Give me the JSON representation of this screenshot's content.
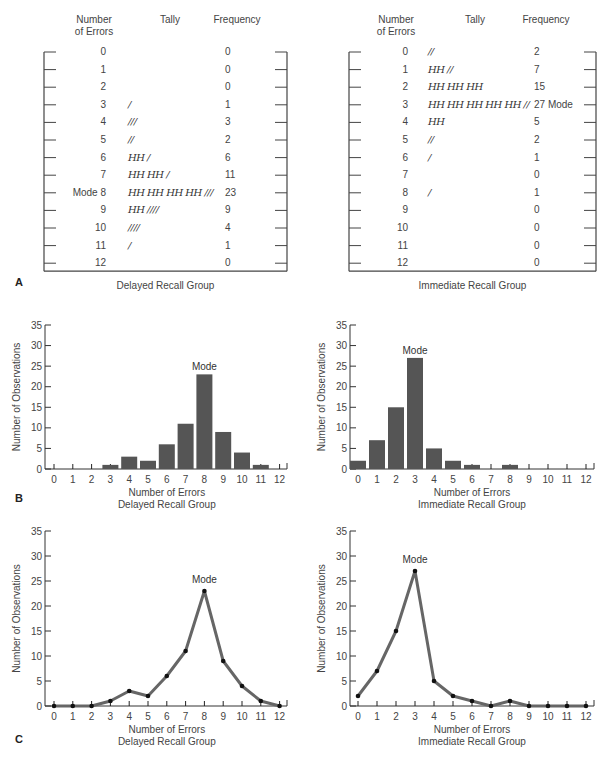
{
  "panels": {
    "A": {
      "letter": "A",
      "tables": [
        {
          "group": "Delayed Recall Group",
          "headers": {
            "errors": "Number\nof Errors",
            "tally": "Tally",
            "frequency": "Frequency"
          },
          "rows": [
            {
              "errors": "0",
              "tally": "",
              "frequency": "0"
            },
            {
              "errors": "1",
              "tally": "",
              "frequency": "0"
            },
            {
              "errors": "2",
              "tally": "",
              "frequency": "0"
            },
            {
              "errors": "3",
              "tally": "/",
              "frequency": "1"
            },
            {
              "errors": "4",
              "tally": "///",
              "frequency": "3"
            },
            {
              "errors": "5",
              "tally": "//",
              "frequency": "2"
            },
            {
              "errors": "6",
              "tally": "HH /",
              "frequency": "6"
            },
            {
              "errors": "7",
              "tally": "HH HH /",
              "frequency": "11"
            },
            {
              "errors": "Mode 8",
              "tally": "HH HH HH HH ///",
              "frequency": "23"
            },
            {
              "errors": "9",
              "tally": "HH ////",
              "frequency": "9"
            },
            {
              "errors": "10",
              "tally": "////",
              "frequency": "4"
            },
            {
              "errors": "11",
              "tally": "/",
              "frequency": "1"
            },
            {
              "errors": "12",
              "tally": "",
              "frequency": "0"
            }
          ]
        },
        {
          "group": "Immediate Recall Group",
          "headers": {
            "errors": "Number\nof Errors",
            "tally": "Tally",
            "frequency": "Frequency"
          },
          "rows": [
            {
              "errors": "0",
              "tally": "//",
              "frequency": "2"
            },
            {
              "errors": "1",
              "tally": "HH //",
              "frequency": "7"
            },
            {
              "errors": "2",
              "tally": "HH HH HH",
              "frequency": "15"
            },
            {
              "errors": "3",
              "tally": "HH HH HH HH HH //",
              "frequency": "27 Mode"
            },
            {
              "errors": "4",
              "tally": "HH",
              "frequency": "5"
            },
            {
              "errors": "5",
              "tally": "//",
              "frequency": "2"
            },
            {
              "errors": "6",
              "tally": "/",
              "frequency": "1"
            },
            {
              "errors": "7",
              "tally": "",
              "frequency": "0"
            },
            {
              "errors": "8",
              "tally": "/",
              "frequency": "1"
            },
            {
              "errors": "9",
              "tally": "",
              "frequency": "0"
            },
            {
              "errors": "10",
              "tally": "",
              "frequency": "0"
            },
            {
              "errors": "11",
              "tally": "",
              "frequency": "0"
            },
            {
              "errors": "12",
              "tally": "",
              "frequency": "0"
            }
          ]
        }
      ]
    },
    "B": {
      "letter": "B"
    },
    "C": {
      "letter": "C"
    }
  },
  "chart_data": [
    {
      "panel": "B-left",
      "type": "bar",
      "title": "",
      "xlabel": "Number of Errors",
      "subtitle": "Delayed Recall Group",
      "ylabel": "Number of Observations",
      "categories": [
        "0",
        "1",
        "2",
        "3",
        "4",
        "5",
        "6",
        "7",
        "8",
        "9",
        "10",
        "11",
        "12"
      ],
      "values": [
        0,
        0,
        0,
        1,
        3,
        2,
        6,
        11,
        23,
        9,
        4,
        1,
        0
      ],
      "yticks": [
        0,
        5,
        10,
        15,
        20,
        25,
        30,
        35
      ],
      "ylim": [
        0,
        35
      ],
      "annotation": {
        "text": "Mode",
        "x": "8"
      },
      "grid": false,
      "bar_color": "#555555"
    },
    {
      "panel": "B-right",
      "type": "bar",
      "title": "",
      "xlabel": "Number of Errors",
      "subtitle": "Immediate Recall Group",
      "ylabel": "Number of Observations",
      "categories": [
        "0",
        "1",
        "2",
        "3",
        "4",
        "5",
        "6",
        "7",
        "8",
        "9",
        "10",
        "11",
        "12"
      ],
      "values": [
        2,
        7,
        15,
        27,
        5,
        2,
        1,
        0,
        1,
        0,
        0,
        0,
        0
      ],
      "yticks": [
        0,
        5,
        10,
        15,
        20,
        25,
        30,
        35
      ],
      "ylim": [
        0,
        35
      ],
      "annotation": {
        "text": "Mode",
        "x": "3"
      },
      "grid": false,
      "bar_color": "#555555"
    },
    {
      "panel": "C-left",
      "type": "line",
      "title": "",
      "xlabel": "Number of Errors",
      "subtitle": "Delayed Recall Group",
      "ylabel": "Number of Observations",
      "categories": [
        "0",
        "1",
        "2",
        "3",
        "4",
        "5",
        "6",
        "7",
        "8",
        "9",
        "10",
        "11",
        "12"
      ],
      "values": [
        0,
        0,
        0,
        1,
        3,
        2,
        6,
        11,
        23,
        9,
        4,
        1,
        0
      ],
      "yticks": [
        0,
        5,
        10,
        15,
        20,
        25,
        30,
        35
      ],
      "ylim": [
        0,
        35
      ],
      "annotation": {
        "text": "Mode",
        "x": "8"
      },
      "grid": false,
      "line_color": "#666666",
      "marker_color": "#111111"
    },
    {
      "panel": "C-right",
      "type": "line",
      "title": "",
      "xlabel": "Number of Errors",
      "subtitle": "Immediate Recall Group",
      "ylabel": "Number of Observations",
      "categories": [
        "0",
        "1",
        "2",
        "3",
        "4",
        "5",
        "6",
        "7",
        "8",
        "9",
        "10",
        "11",
        "12"
      ],
      "values": [
        2,
        7,
        15,
        27,
        5,
        2,
        1,
        0,
        1,
        0,
        0,
        0,
        0
      ],
      "yticks": [
        0,
        5,
        10,
        15,
        20,
        25,
        30,
        35
      ],
      "ylim": [
        0,
        35
      ],
      "annotation": {
        "text": "Mode",
        "x": "3"
      },
      "grid": false,
      "line_color": "#666666",
      "marker_color": "#111111"
    }
  ]
}
